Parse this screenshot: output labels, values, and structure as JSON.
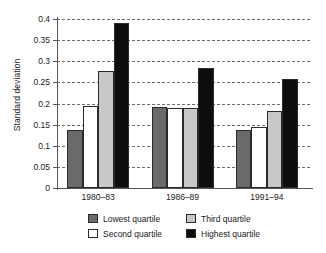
{
  "chart_data": {
    "type": "bar",
    "title": "",
    "xlabel": "",
    "ylabel": "Standard deviation",
    "categories": [
      "1980–83",
      "1986–89",
      "1991–94"
    ],
    "ylim": [
      0,
      0.4
    ],
    "yticks": [
      0,
      0.05,
      0.1,
      0.15,
      0.2,
      0.25,
      0.3,
      0.35,
      0.4
    ],
    "ytick_labels": [
      "0",
      "0.05",
      "0.1",
      "0.15",
      "0.2",
      "0.25",
      "0.3",
      "0.35",
      "0.4"
    ],
    "grid": "horizontal-dashed",
    "legend_position": "bottom",
    "series": [
      {
        "name": "Lowest quartile",
        "color": "#6a6a6a",
        "values": [
          0.138,
          0.191,
          0.137
        ]
      },
      {
        "name": "Second quartile",
        "color": "#ffffff",
        "values": [
          0.195,
          0.19,
          0.145
        ]
      },
      {
        "name": "Third quartile",
        "color": "#c8c8c8",
        "values": [
          0.277,
          0.189,
          0.182
        ]
      },
      {
        "name": "Highest quartile",
        "color": "#0d0d0d",
        "values": [
          0.39,
          0.283,
          0.259
        ]
      }
    ]
  },
  "legend": {
    "entries": [
      {
        "label": "Lowest quartile",
        "color": "#6a6a6a"
      },
      {
        "label": "Third quartile",
        "color": "#c8c8c8"
      },
      {
        "label": "Second quartile",
        "color": "#ffffff"
      },
      {
        "label": "Highest quartile",
        "color": "#0d0d0d"
      }
    ]
  },
  "colors": {
    "axis": "#555555",
    "grid": "#6f6f6f",
    "text": "#1a1a1a",
    "background": "#ffffff"
  }
}
